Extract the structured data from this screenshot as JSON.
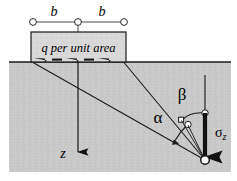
{
  "figure": {
    "name": "strip-load-stress-diagram",
    "colors": {
      "soil_fill": "#c9c9c9",
      "strip_fill": "#d8d8d8",
      "line": "#1a1a1a",
      "marker_fill": "#ffffff",
      "background": "#ffffff"
    }
  },
  "labels": {
    "dimension_left": "b",
    "dimension_right": "b",
    "load": "q per unit area",
    "depth_axis": "z",
    "angle_alpha": "α",
    "angle_beta": "β",
    "stress_symbol": "σ",
    "stress_subscript": "z"
  },
  "geometry": {
    "ground_line_y": 62,
    "strip_left_x": 31,
    "strip_right_x": 126,
    "strip_center_x": 78,
    "strip_top_y": 32,
    "soil_left_x": 9,
    "soil_right_x": 231,
    "soil_bottom_y": 172,
    "point_x": 205,
    "point_y": 160,
    "vertex_top_y": 113,
    "vertex_mid_y": 125
  }
}
